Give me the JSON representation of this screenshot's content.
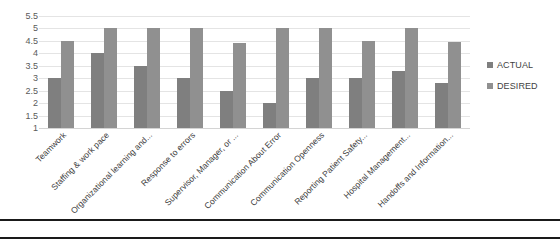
{
  "chart_data": {
    "type": "bar",
    "title": "",
    "xlabel": "",
    "ylabel": "",
    "ylim": [
      1,
      5.5
    ],
    "grid": true,
    "legend_position": "right",
    "y_ticks": [
      "1",
      "1.5",
      "2",
      "2.5",
      "3",
      "3.5",
      "4",
      "4.5",
      "5",
      "5.5"
    ],
    "y_tick_values": [
      1,
      1.5,
      2,
      2.5,
      3,
      3.5,
      4,
      4.5,
      5,
      5.5
    ],
    "categories": [
      "Teamwork",
      "Staffing & work pace",
      "Organizational learning and...",
      "Response to errors",
      "Supervisor, Manager, or ...",
      "Communication About Error",
      "Communication Openness",
      "Reporting Patient Safety...",
      "Hospital Management...",
      "Handoffs and Information..."
    ],
    "series": [
      {
        "name": "ACTUAL",
        "color": "#7f7f7f",
        "values": [
          3.0,
          4.0,
          3.5,
          3.0,
          2.5,
          2.0,
          3.0,
          3.0,
          3.3,
          2.8
        ]
      },
      {
        "name": "DESIRED",
        "color": "#909090",
        "values": [
          4.5,
          5.0,
          5.0,
          5.0,
          4.4,
          5.0,
          5.0,
          4.5,
          5.0,
          4.45
        ]
      }
    ]
  },
  "legend": {
    "items": [
      {
        "label": "ACTUAL"
      },
      {
        "label": "DESIRED"
      }
    ]
  }
}
